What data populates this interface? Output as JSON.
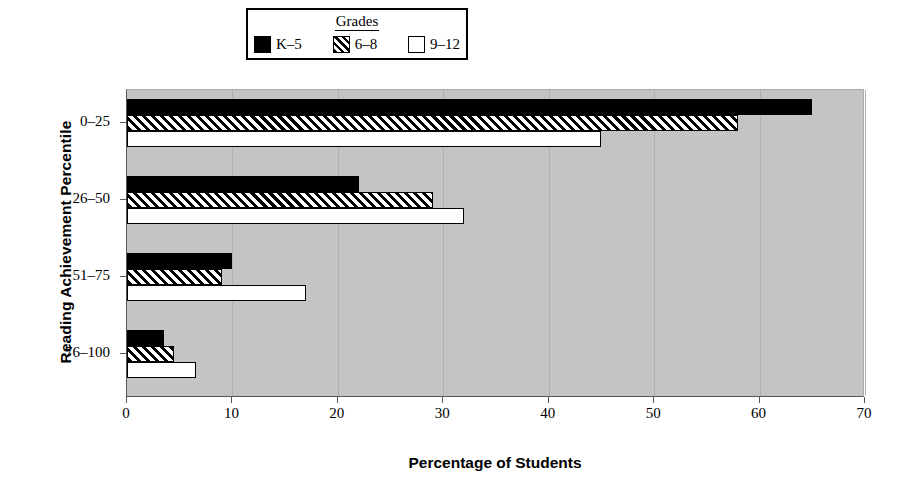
{
  "chart_data": {
    "type": "bar",
    "orientation": "horizontal",
    "title": "",
    "xlabel": "Percentage of Students",
    "ylabel": "Reading Achievement Percentile",
    "categories": [
      "0–25",
      "26–50",
      "51–75",
      "76–100"
    ],
    "series": [
      {
        "name": "K–5",
        "values": [
          65,
          22,
          10,
          3.5
        ],
        "style": "solid",
        "color": "#000000"
      },
      {
        "name": "6–8",
        "values": [
          58,
          29,
          9,
          4.5
        ],
        "style": "hatch",
        "color": "#000000"
      },
      {
        "name": "9–12",
        "values": [
          45,
          32,
          17,
          6.5
        ],
        "style": "white",
        "color": "#ffffff"
      }
    ],
    "xlim": [
      0,
      70
    ],
    "xticks": [
      0,
      10,
      20,
      30,
      40,
      50,
      60,
      70
    ],
    "xticklabels": [
      "0",
      "10",
      "20",
      "30",
      "40",
      "50",
      "60",
      "70"
    ],
    "grid": true,
    "gridlines_axis": "x",
    "plot_background": "#c4c4c4",
    "legend": {
      "title": "Grades",
      "position": "top-center",
      "entries": [
        "K–5",
        "6–8",
        "9–12"
      ]
    }
  },
  "legend": {
    "title": "Grades",
    "items": [
      {
        "label": "K–5",
        "swatch": "solid-swatch"
      },
      {
        "label": "6–8",
        "swatch": "hatched-swatch"
      },
      {
        "label": "9–12",
        "swatch": "white-swatch"
      }
    ]
  },
  "axes": {
    "x_title": "Percentage of Students",
    "y_title": "Reading Achievement Percentile",
    "x_ticklabels": [
      "0",
      "10",
      "20",
      "30",
      "40",
      "50",
      "60",
      "70"
    ],
    "y_ticklabels": [
      "0–25",
      "26–50",
      "51–75",
      "76–100"
    ]
  }
}
